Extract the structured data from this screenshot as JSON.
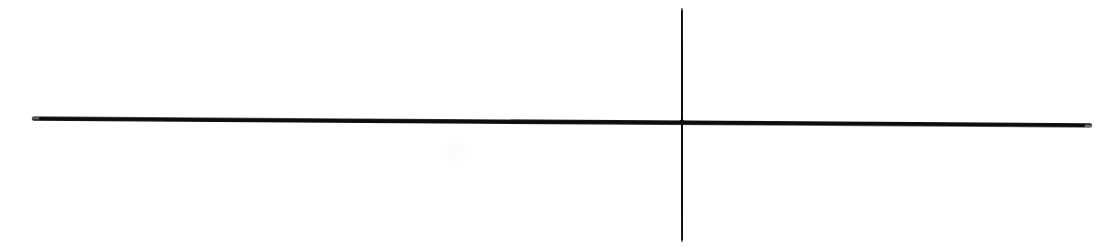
{
  "figure": {
    "title": "Hand-drawn cross / plus mark",
    "description": "Two dark intersecting strokes on a plain white background forming a cross (plus) shape.",
    "background_color": "#ffffff",
    "canvas": {
      "width": 1117,
      "height": 247,
      "units": "px"
    },
    "stroke": {
      "color": "#191919",
      "core_color": "#111111",
      "edge_color": "#4a4a4a",
      "linecap": "round"
    },
    "strokes": [
      {
        "id": "horizontal-stroke",
        "name": "horizontal-line",
        "orientation": "horizontal",
        "x1": 34,
        "y1": 118.5,
        "x2": 1090,
        "y2": 125.5,
        "width": 4.6,
        "length_px": 1056,
        "slope_note": "slight downward tilt from left to right"
      },
      {
        "id": "vertical-stroke",
        "name": "vertical-line",
        "orientation": "vertical",
        "x1": 681.5,
        "y1": 10,
        "x2": 682.5,
        "y2": 240,
        "width": 4.2,
        "length_px": 230,
        "slope_note": "essentially plumb vertical"
      }
    ],
    "intersection": {
      "name": "crossing-point",
      "x": 682,
      "y": 122,
      "label": "(682, 122)"
    },
    "smudge": {
      "name": "paper-smudge",
      "x": 455,
      "y": 152,
      "radius": 14,
      "color": "#fcfcfc",
      "visible_note": "faint paper texture mark, barely perceptible"
    }
  },
  "chart_data": {
    "type": "line",
    "title": "Hand-drawn cross / plus mark",
    "xlabel": "",
    "ylabel": "",
    "xlim": [
      0,
      1117
    ],
    "ylim": [
      0,
      247
    ],
    "grid": false,
    "legend": "none",
    "series": [
      {
        "name": "horizontal-line",
        "x": [
          34,
          1090
        ],
        "y": [
          118.5,
          125.5
        ]
      },
      {
        "name": "vertical-line",
        "x": [
          681.5,
          682.5
        ],
        "y": [
          10,
          240
        ]
      }
    ],
    "annotations": [
      {
        "name": "intersection",
        "x": 682,
        "y": 122,
        "text": ""
      }
    ]
  }
}
